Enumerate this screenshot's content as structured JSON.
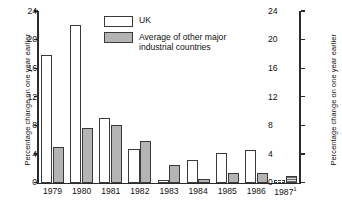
{
  "chart_data": {
    "type": "bar",
    "title": "",
    "subtitle": "",
    "xlabel": "",
    "ylabel": "Percentage change on one year earlier",
    "ylabel_right": "Percentage change on one year earlier",
    "categories": [
      "1979",
      "1980",
      "1981",
      "1982",
      "1983",
      "1984",
      "1985",
      "1986",
      "1987"
    ],
    "category_labels": [
      "1979",
      "1980",
      "1981",
      "1982",
      "1983",
      "1984",
      "1985",
      "1986",
      "1987"
    ],
    "category_footnote_marks": [
      "",
      "",
      "",
      "",
      "",
      "",
      "",
      "",
      "1"
    ],
    "series": [
      {
        "name": "UK",
        "color": "#ffffff",
        "values": [
          17.8,
          22.0,
          9.0,
          4.7,
          0.3,
          3.2,
          4.1,
          4.5,
          0.3
        ],
        "projected": [
          false,
          false,
          false,
          false,
          false,
          false,
          false,
          false,
          true
        ]
      },
      {
        "name": "Average of other major\nindustrial countries",
        "color": "#b4b4b4",
        "values": [
          5.0,
          7.6,
          8.1,
          5.8,
          2.5,
          0.5,
          1.3,
          1.4,
          0.9
        ],
        "projected": [
          false,
          false,
          false,
          false,
          false,
          false,
          false,
          false,
          true
        ]
      }
    ],
    "ylim": [
      0,
      24
    ],
    "yticks": [
      0,
      4,
      8,
      12,
      16,
      20,
      24
    ],
    "ytick_labels": [
      "0",
      "4",
      "8",
      "12",
      "16",
      "20",
      "24"
    ],
    "grid": false,
    "legend_position": "top-center",
    "axes": "dual-y-identical"
  },
  "legend": {
    "items": [
      {
        "label": "UK",
        "swatch": "uk-swatch"
      },
      {
        "label": "Average of other major\nindustrial countries",
        "swatch": "other-swatch"
      }
    ]
  }
}
